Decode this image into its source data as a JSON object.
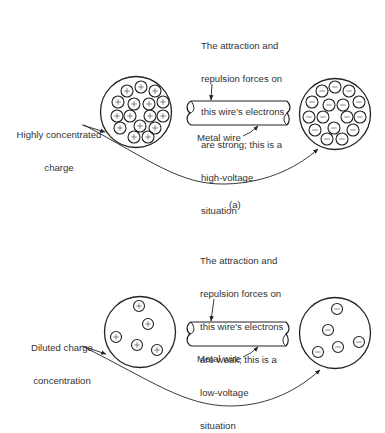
{
  "panel_a": {
    "callout_lines": [
      "The attraction and",
      "repulsion forces on",
      "this wire's electrons",
      "are strong; this is a",
      "high-voltage",
      "situation"
    ],
    "left_label_lines": [
      "Highly concentrated",
      "charge"
    ],
    "wire_label": "Metal wire",
    "caption": "(a)",
    "left_charge_symbol": "+",
    "right_charge_symbol": "−",
    "left_charges": [
      [
        127,
        91
      ],
      [
        141,
        87
      ],
      [
        155,
        91
      ],
      [
        118,
        102
      ],
      [
        134,
        104
      ],
      [
        149,
        104
      ],
      [
        163,
        102
      ],
      [
        117,
        116
      ],
      [
        130,
        116
      ],
      [
        150,
        116
      ],
      [
        163,
        116
      ],
      [
        120,
        128
      ],
      [
        140,
        126
      ],
      [
        155,
        128
      ],
      [
        134,
        137
      ],
      [
        148,
        137
      ]
    ],
    "right_charges": [
      [
        322,
        91
      ],
      [
        335,
        87
      ],
      [
        349,
        91
      ],
      [
        312,
        102
      ],
      [
        329,
        105
      ],
      [
        343,
        105
      ],
      [
        359,
        102
      ],
      [
        309,
        117
      ],
      [
        323,
        117
      ],
      [
        347,
        117
      ],
      [
        360,
        117
      ],
      [
        315,
        130
      ],
      [
        334,
        128
      ],
      [
        353,
        130
      ],
      [
        327,
        139
      ],
      [
        342,
        139
      ]
    ]
  },
  "panel_b": {
    "callout_lines": [
      "The attraction and",
      "repulsion forces on",
      "this wire's electrons",
      "are weak; this is a",
      "low-voltage",
      "situation"
    ],
    "left_label_lines": [
      "Diluted charge",
      "concentration"
    ],
    "wire_label": "Metal wire",
    "left_charge_symbol": "+",
    "right_charge_symbol": "−",
    "left_charges": [
      [
        139,
        306
      ],
      [
        148,
        324
      ],
      [
        116,
        337
      ],
      [
        137,
        345
      ],
      [
        157,
        350
      ]
    ],
    "right_charges": [
      [
        337,
        309
      ],
      [
        328,
        330
      ],
      [
        359,
        342
      ],
      [
        338,
        347
      ],
      [
        318,
        352
      ]
    ]
  }
}
